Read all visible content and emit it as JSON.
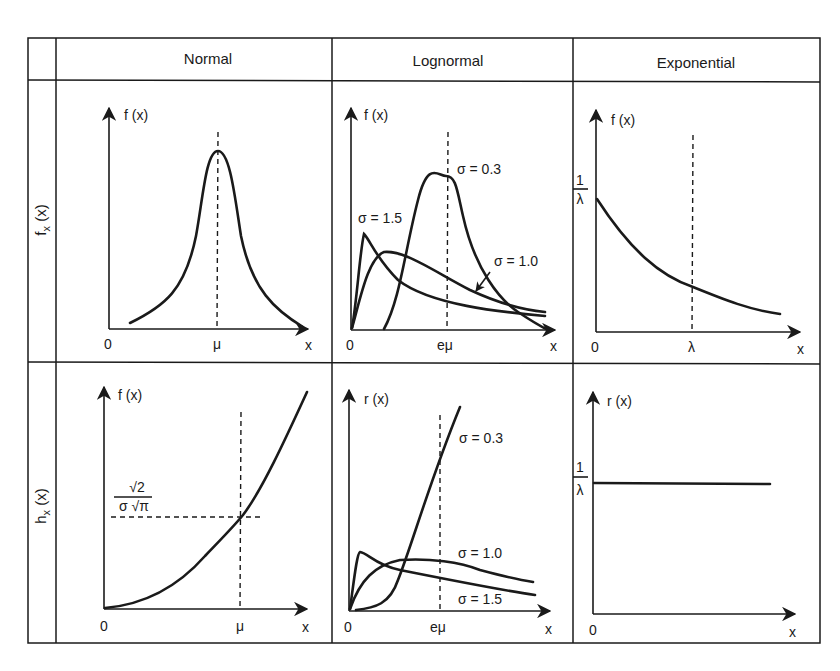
{
  "table": {
    "columns": [
      "Normal",
      "Lognormal",
      "Exponential"
    ],
    "rows": [
      {
        "label_main": "f",
        "label_sub": "x",
        "label_arg": " (x)"
      },
      {
        "label_main": "h",
        "label_sub": "x",
        "label_arg": " (x)"
      }
    ]
  },
  "panels": {
    "normal_pdf": {
      "y_label": "f (x)",
      "origin": "0",
      "x_tick": "μ",
      "x_label": "x"
    },
    "lognormal_pdf": {
      "y_label": "f (x)",
      "origin": "0",
      "x_tick": "eμ",
      "x_label": "x",
      "curves": [
        "σ = 0.3",
        "σ = 1.5",
        "σ = 1.0"
      ]
    },
    "exponential_pdf": {
      "y_label": "f (x)",
      "origin": "0",
      "x_tick": "λ",
      "x_label": "x",
      "y_tick_num": "1",
      "y_tick_den": "λ"
    },
    "normal_hazard": {
      "y_label": "f (x)",
      "origin": "0",
      "x_tick": "μ",
      "x_label": "x",
      "y_tick_num": "√2",
      "y_tick_den": "σ √π"
    },
    "lognormal_hazard": {
      "y_label": "r (x)",
      "origin": "0",
      "x_tick": "eμ",
      "x_label": "x",
      "curves": [
        "σ = 0.3",
        "σ = 1.0",
        "σ = 1.5"
      ]
    },
    "exponential_hazard": {
      "y_label": "r (x)",
      "origin": "0",
      "x_label": "x",
      "y_tick_num": "1",
      "y_tick_den": "λ"
    }
  },
  "colors": {
    "ink": "#1a1a1a",
    "background": "#ffffff"
  }
}
